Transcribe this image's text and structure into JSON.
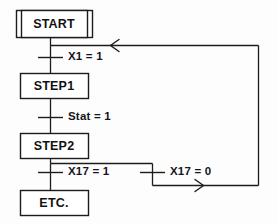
{
  "diagram": {
    "type": "sequential-function-chart",
    "title": "",
    "steps": [
      {
        "id": "start",
        "label": "START",
        "kind": "initial-step",
        "x": 16,
        "y": 10,
        "w": 76,
        "h": 28
      },
      {
        "id": "step1",
        "label": "STEP1",
        "kind": "step",
        "x": 20,
        "y": 73,
        "w": 68,
        "h": 26
      },
      {
        "id": "step2",
        "label": "STEP2",
        "kind": "step",
        "x": 20,
        "y": 133,
        "w": 68,
        "h": 26
      },
      {
        "id": "etc",
        "label": "ETC.",
        "kind": "step",
        "x": 20,
        "y": 190,
        "w": 68,
        "h": 26
      }
    ],
    "transitions": [
      {
        "id": "t1",
        "label": "X1 = 1",
        "from": "start",
        "to": "step1",
        "tick_y": 57,
        "label_x": 65,
        "label_y": 50
      },
      {
        "id": "t2",
        "label": "Stat = 1",
        "from": "step1",
        "to": "step2",
        "tick_y": 117,
        "label_x": 65,
        "label_y": 110
      },
      {
        "id": "t3",
        "label": "X17 = 1",
        "from": "step2",
        "to": "etc",
        "tick_y": 172,
        "label_x": 65,
        "label_y": 165
      },
      {
        "id": "t4",
        "label": "X17 = 0",
        "from": "step2",
        "to": "start",
        "tick_y": 172,
        "label_x": 167,
        "label_y": 165
      }
    ],
    "arrows": [
      {
        "id": "return-arrow-left",
        "glyph": "<",
        "direction": "left",
        "x": 112,
        "y": 45
      },
      {
        "id": "branch-arrow-right",
        "glyph": ">",
        "direction": "right",
        "x": 200,
        "y": 185
      }
    ],
    "colors": {
      "line": "#1c1c1c",
      "box_stroke": "#1c1c1c",
      "box_fill": "#ffffff",
      "text": "#121212",
      "background": "#fdfdfd"
    }
  }
}
